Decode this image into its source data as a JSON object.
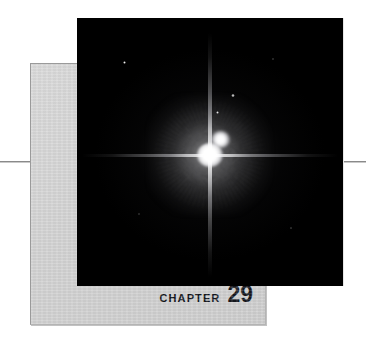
{
  "page": {
    "type": "book-chapter-opener",
    "background_color": "#ffffff"
  },
  "rules": {
    "left_rule_name": "horizontal-rule-left",
    "right_rule_name": "horizontal-rule-right",
    "color": "#8a8a8a"
  },
  "chapter_panel": {
    "background_color": "#d2d2d2",
    "border_color": "#9a9a9a"
  },
  "chapter_label": {
    "word": "CHAPTER",
    "number": "29",
    "text_color": "#14161c"
  },
  "photo": {
    "name": "star-photograph",
    "background_color": "#000000",
    "subject": "bright double star with diffraction spikes",
    "objects": [
      {
        "name": "primary-star",
        "x": 133,
        "y": 137,
        "brightness": "very bright"
      },
      {
        "name": "companion-star",
        "x": 144,
        "y": 125,
        "brightness": "bright"
      },
      {
        "name": "field-star-1",
        "x": 47,
        "y": 44,
        "size": 3.0,
        "brightness": "faint"
      },
      {
        "name": "field-star-2",
        "x": 156,
        "y": 77,
        "size": 3.4,
        "brightness": "faint"
      },
      {
        "name": "field-star-3",
        "x": 140,
        "y": 94,
        "size": 3.0,
        "brightness": "faint"
      },
      {
        "name": "field-star-4",
        "x": 196,
        "y": 41,
        "size": 1.8,
        "brightness": "very faint"
      },
      {
        "name": "field-star-5",
        "x": 62,
        "y": 196,
        "size": 1.6,
        "brightness": "very faint"
      },
      {
        "name": "field-star-6",
        "x": 214,
        "y": 210,
        "size": 1.7,
        "brightness": "very faint"
      }
    ]
  }
}
